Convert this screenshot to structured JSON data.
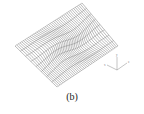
{
  "figure": {
    "caption": "(b)",
    "type": "3d-wireframe-surface",
    "line_color": "#333333",
    "background": "#ffffff"
  },
  "axes_triad": {
    "x_label": "x",
    "y_label": "y",
    "z_label": "z",
    "color": "#888888"
  }
}
